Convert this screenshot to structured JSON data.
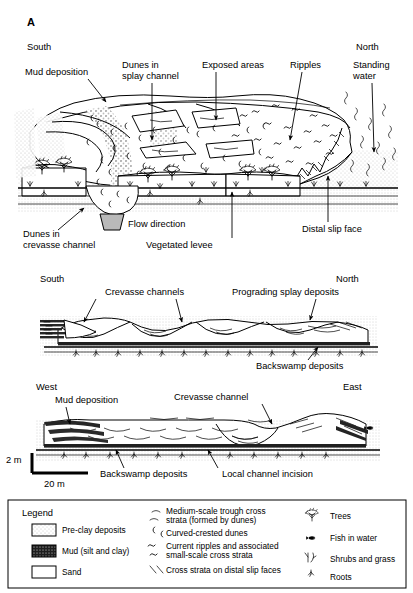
{
  "figure": {
    "panel_label": "A",
    "panels": [
      {
        "id": "block-diagram",
        "direction_left": "South",
        "direction_right": "North",
        "labels": [
          "Mud deposition",
          "Dunes in\nsplay channel",
          "Exposed areas",
          "Ripples",
          "Standing\nwater",
          "Dunes in\ncrevasse channel",
          "Flow direction",
          "Vegetated levee",
          "Distal slip face"
        ],
        "label_mud_deposition": "Mud deposition",
        "label_dunes_splay_l1": "Dunes in",
        "label_dunes_splay_l2": "splay channel",
        "label_exposed_areas": "Exposed areas",
        "label_ripples": "Ripples",
        "label_standing_water_l1": "Standing",
        "label_standing_water_l2": "water",
        "label_dunes_crevasse_l1": "Dunes in",
        "label_dunes_crevasse_l2": "crevasse channel",
        "label_flow_direction": "Flow direction",
        "label_vegetated_levee": "Vegetated levee",
        "label_distal_slip_face": "Distal slip face"
      },
      {
        "id": "cross-section-south-north",
        "direction_left": "South",
        "direction_right": "North",
        "label_crevasse_channels": "Crevasse channels",
        "label_prograding_splay": "Prograding splay deposits",
        "label_backswamp": "Backswamp deposits"
      },
      {
        "id": "cross-section-west-east",
        "direction_left": "West",
        "direction_right": "East",
        "label_mud_deposition": "Mud deposition",
        "label_crevasse_channel": "Crevasse channel",
        "label_backswamp": "Backswamp deposits",
        "label_local_incision": "Local channel incision",
        "scale_vertical": "2 m",
        "scale_horizontal": "20 m"
      }
    ],
    "legend": {
      "title": "Legend",
      "column1": [
        {
          "swatch": "pre-clay-stipple-swatch",
          "label": "Pre-clay deposits"
        },
        {
          "swatch": "mud-dark-swatch",
          "label": "Mud (silt and clay)"
        },
        {
          "swatch": "sand-white-swatch",
          "label": "Sand"
        }
      ],
      "column2": [
        {
          "symbol": "trough-cross-strata-icon",
          "label": "Medium-scale trough cross\nstrata (formed by dunes)",
          "line1": "Medium-scale trough cross",
          "line2": "strata (formed by dunes)"
        },
        {
          "symbol": "curved-crested-dune-icon",
          "label": "Curved-crested dunes",
          "line1": "Curved-crested dunes",
          "line2": ""
        },
        {
          "symbol": "current-ripple-icon",
          "label": "Current ripples and associated\nsmall-scale cross strata",
          "line1": "Current ripples and associated",
          "line2": "small-scale cross strata"
        },
        {
          "symbol": "slip-face-cross-strata-icon",
          "label": "Cross strata on distal slip faces",
          "line1": "Cross strata on distal slip faces",
          "line2": ""
        }
      ],
      "column3": [
        {
          "symbol": "tree-icon",
          "label": "Trees"
        },
        {
          "symbol": "fish-icon",
          "label": "Fish in water"
        },
        {
          "symbol": "shrubs-grass-icon",
          "label": "Shrubs and grass"
        },
        {
          "symbol": "roots-icon",
          "label": "Roots"
        }
      ]
    },
    "colors": {
      "ink": "#000000",
      "mud_dark": "#222222",
      "stipple_gray": "#b9b9b9",
      "background": "#ffffff"
    }
  }
}
